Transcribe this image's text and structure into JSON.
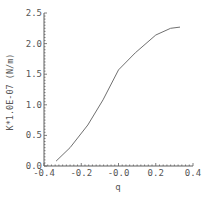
{
  "chart_data": {
    "type": "line",
    "title": "",
    "xlabel": "q",
    "ylabel": "K*1.0E-07 (N/m)",
    "xlim": [
      -0.4,
      0.4
    ],
    "ylim": [
      0.0,
      2.5
    ],
    "x_ticks": [
      "-0.4",
      "-0.2",
      "-0.0",
      "0.2",
      "0.4"
    ],
    "y_ticks": [
      "0.0",
      "0.5",
      "1.0",
      "1.5",
      "2.0",
      "2.5"
    ],
    "grid": false,
    "legend": null,
    "series": [
      {
        "name": "K",
        "color": "#707070",
        "x": [
          -0.335,
          -0.26,
          -0.165,
          -0.083,
          0.0,
          0.09,
          0.2,
          0.28,
          0.33
        ],
        "values": [
          0.08,
          0.3,
          0.67,
          1.08,
          1.57,
          1.85,
          2.14,
          2.25,
          2.27
        ]
      }
    ]
  },
  "axis": {
    "color": "#606060"
  }
}
